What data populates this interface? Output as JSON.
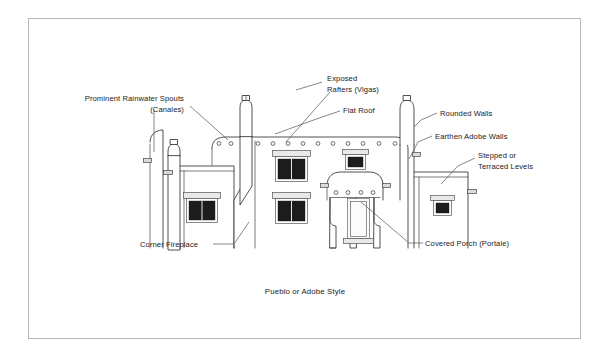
{
  "figure": {
    "caption": "Pueblo or Adobe Style",
    "frame": {
      "color": "#b8b8b8",
      "background": "#ffffff"
    },
    "line_color": "#333333",
    "leader_color": "#555555",
    "glass_color": "#1c1c1c"
  },
  "labels": [
    {
      "id": "canales",
      "line1": "Prominent Rainwater Spouts",
      "line2": "(Canales)",
      "align": "right",
      "x": 184,
      "y": 101
    },
    {
      "id": "vigas",
      "line1": "Exposed",
      "line2": "Rafters (Vigas)",
      "align": "left",
      "x": 327,
      "y": 81
    },
    {
      "id": "flat-roof",
      "line1": "Flat Roof",
      "line2": "",
      "align": "left",
      "x": 343,
      "y": 110
    },
    {
      "id": "rounded-walls",
      "line1": "Rounded Walls",
      "line2": "",
      "align": "left",
      "x": 440,
      "y": 113
    },
    {
      "id": "earthen-adobe-walls",
      "line1": "Earthen Adobe Walls",
      "line2": "",
      "align": "left",
      "x": 435,
      "y": 136
    },
    {
      "id": "stepped-levels",
      "line1": "Stepped or",
      "line2": "Terraced Levels",
      "align": "left",
      "x": 478,
      "y": 155
    },
    {
      "id": "corner-fireplace",
      "line1": "Corner Fireplace",
      "line2": "",
      "align": "left",
      "x": 140,
      "y": 245
    },
    {
      "id": "covered-porch",
      "line1": "Covered Porch (Portale)",
      "line2": "",
      "align": "left",
      "x": 425,
      "y": 243
    }
  ],
  "drawing": {
    "title": "pueblo-adobe-house-elevation",
    "elements": {
      "left_chimney": "chimney-with-cap",
      "main_chimney": "tall-center-chimney",
      "right_chimney": "rounded-right-chimney",
      "vigas_main_count": 10,
      "vigas_left_count": 2,
      "vigas_porch_count": 4,
      "windows_count": 5,
      "door_count": 1
    }
  }
}
